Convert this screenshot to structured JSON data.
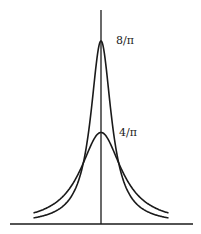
{
  "chart_data": {
    "type": "line",
    "title": "",
    "xlabel": "",
    "ylabel": "",
    "grid": false,
    "legend": null,
    "series": [
      {
        "name": "narrow Lorentzian",
        "gamma": 0.25,
        "peak": 2.5465,
        "peak_label": "8/π"
      },
      {
        "name": "wide Lorentzian",
        "gamma": 0.5,
        "peak": 1.2732,
        "peak_label": "4/π"
      }
    ],
    "formula": "y = (2/π) · γ / (x² + γ²)",
    "x_range": [
      -1.35,
      1.35
    ],
    "annotations": [
      "8/π",
      "4/π"
    ]
  },
  "labels": {
    "peak_high": "8/π",
    "peak_low": "4/π"
  },
  "style": {
    "line_color": "#1a1a1a"
  }
}
